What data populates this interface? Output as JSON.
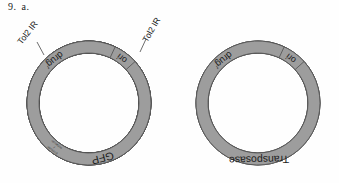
{
  "figure": {
    "number_label": "9.",
    "part_label": "a.",
    "background_color": "#fefefe",
    "segment_fill_dark": "#9d9d9d",
    "segment_fill_light": "#e8e8e8",
    "outline_color": "#4f4f4f"
  },
  "plasmids": [
    {
      "id": "donor-plasmid",
      "center_x": 89,
      "center_y": 103,
      "outer_radius": 62,
      "inner_radius": 50,
      "segments": [
        {
          "name": "tol2-ir-left",
          "label": "",
          "fill": "light",
          "start_angle": 196,
          "end_angle": 214
        },
        {
          "name": "promoter-enhancer",
          "label": "promoter / enhancer",
          "fill": "dark",
          "start_angle": 216,
          "end_angle": 248
        },
        {
          "name": "gfp",
          "label": "GFP",
          "fill": "dark",
          "start_angle": 250,
          "end_angle": 318
        },
        {
          "name": "tol2-ir-right",
          "label": "",
          "fill": "light",
          "start_angle": 320,
          "end_angle": 340
        },
        {
          "name": "drug-resistance",
          "label": "drug",
          "superscript": "r",
          "fill": "dark",
          "start_angle": 108,
          "end_angle": 150
        },
        {
          "name": "origin-of-replication",
          "label": "ori",
          "fill": "dark",
          "start_angle": 42,
          "end_angle": 65
        }
      ],
      "callouts": [
        {
          "name": "tol2-ir-left-callout",
          "text": "Tol2 IR",
          "x": 28,
          "y": 33,
          "rotation": -52,
          "leader_from_x": 37,
          "leader_from_y": 42,
          "leader_to_x": 44,
          "leader_to_y": 55
        },
        {
          "name": "tol2-ir-right-callout",
          "text": "Tol2 IR",
          "x": 152,
          "y": 30,
          "rotation": -60,
          "leader_from_x": 146,
          "leader_from_y": 39,
          "leader_to_x": 140,
          "leader_to_y": 52
        }
      ]
    },
    {
      "id": "helper-plasmid",
      "center_x": 258,
      "center_y": 103,
      "outer_radius": 62,
      "inner_radius": 50,
      "segments": [
        {
          "name": "transposase",
          "label": "Transposase",
          "fill": "dark",
          "start_angle": 205,
          "end_angle": 337
        },
        {
          "name": "drug-resistance",
          "label": "drug",
          "superscript": "r",
          "fill": "dark",
          "start_angle": 108,
          "end_angle": 150
        },
        {
          "name": "origin-of-replication",
          "label": "ori",
          "fill": "dark",
          "start_angle": 42,
          "end_angle": 65
        }
      ],
      "callouts": []
    }
  ]
}
